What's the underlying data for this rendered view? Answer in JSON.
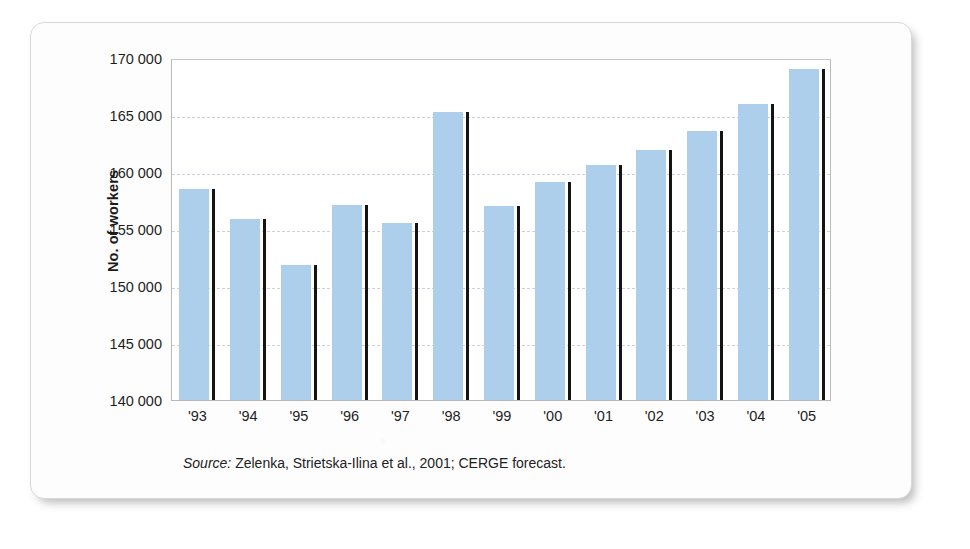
{
  "figure": {
    "source_prefix": "Source:",
    "source_text": "Zelenka, Strietska-Ilina et al., 2001; CERGE forecast.",
    "bar_color": "#aecfeb",
    "bar_edge_color": "#141414",
    "grid_color": "#c9d2dd",
    "frame_color": "#b9b9b9"
  },
  "chart_data": {
    "type": "bar",
    "title": "",
    "xlabel": "",
    "ylabel": "No. of workers",
    "categories": [
      "'93",
      "'94",
      "'95",
      "'96",
      "'97",
      "'98",
      "'99",
      "'00",
      "'01",
      "'02",
      "'03",
      "'04",
      "'05"
    ],
    "values": [
      158500,
      155900,
      151800,
      157100,
      155500,
      165300,
      157000,
      159100,
      160600,
      161900,
      163600,
      166000,
      169000
    ],
    "ylim": [
      140000,
      170000
    ],
    "yticks": [
      140000,
      145000,
      150000,
      155000,
      160000,
      165000,
      170000
    ],
    "ytick_labels": [
      "140 000",
      "145 000",
      "150 000",
      "155 000",
      "160 000",
      "165 000",
      "170 000"
    ],
    "grid": true,
    "grid_axis": "y",
    "legend": "none"
  }
}
